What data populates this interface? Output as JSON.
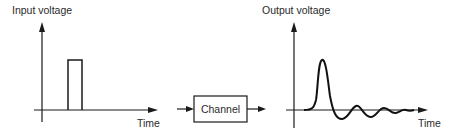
{
  "diagram": {
    "input_plot": {
      "y_label": "Input voltage",
      "x_label": "Time",
      "signal": "rectangular-pulse"
    },
    "channel": {
      "label": "Channel"
    },
    "output_plot": {
      "y_label": "Output voltage",
      "x_label": "Time",
      "signal": "damped-oscillation"
    },
    "colors": {
      "stroke": "#1a1a1a",
      "text": "#2a2a2a",
      "background": "#ffffff"
    }
  }
}
